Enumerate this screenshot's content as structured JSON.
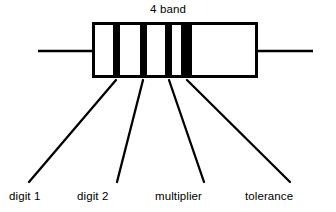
{
  "figure": {
    "title": "4 band",
    "background_color": "#ffffff",
    "ink_color": "#000000"
  },
  "resistor": {
    "body": {
      "x": 92,
      "y": 22,
      "width": 166,
      "height": 56,
      "border_width": 3,
      "fill": "#ffffff",
      "stroke": "#000000"
    },
    "leads": [
      {
        "name": "left-lead",
        "x1": 38,
        "y1": 51,
        "x2": 92,
        "y2": 51,
        "width": 2.4
      },
      {
        "name": "right-lead",
        "x1": 258,
        "y1": 51,
        "x2": 313,
        "y2": 51,
        "width": 2.4
      }
    ],
    "bands": [
      {
        "name": "band-digit-1",
        "label": "digit 1",
        "x": 113,
        "width": 7,
        "color": "#000000"
      },
      {
        "name": "band-digit-2",
        "label": "digit 2",
        "x": 140,
        "width": 7,
        "color": "#000000"
      },
      {
        "name": "band-multiplier",
        "label": "multiplier",
        "x": 165,
        "width": 7,
        "color": "#000000"
      },
      {
        "name": "band-tolerance",
        "label": "tolerance",
        "x": 181,
        "width": 11,
        "color": "#000000"
      }
    ]
  },
  "callouts": [
    {
      "name": "callout-digit-1",
      "label": "digit 1",
      "line": {
        "x1": 116,
        "y1": 80,
        "x2": 29,
        "y2": 182
      }
    },
    {
      "name": "callout-digit-2",
      "label": "digit 2",
      "line": {
        "x1": 143,
        "y1": 80,
        "x2": 117,
        "y2": 182
      }
    },
    {
      "name": "callout-multiplier",
      "label": "multiplier",
      "line": {
        "x1": 169,
        "y1": 80,
        "x2": 204,
        "y2": 182
      }
    },
    {
      "name": "callout-tolerance",
      "label": "tolerance",
      "line": {
        "x1": 187,
        "y1": 80,
        "x2": 290,
        "y2": 182
      }
    }
  ]
}
